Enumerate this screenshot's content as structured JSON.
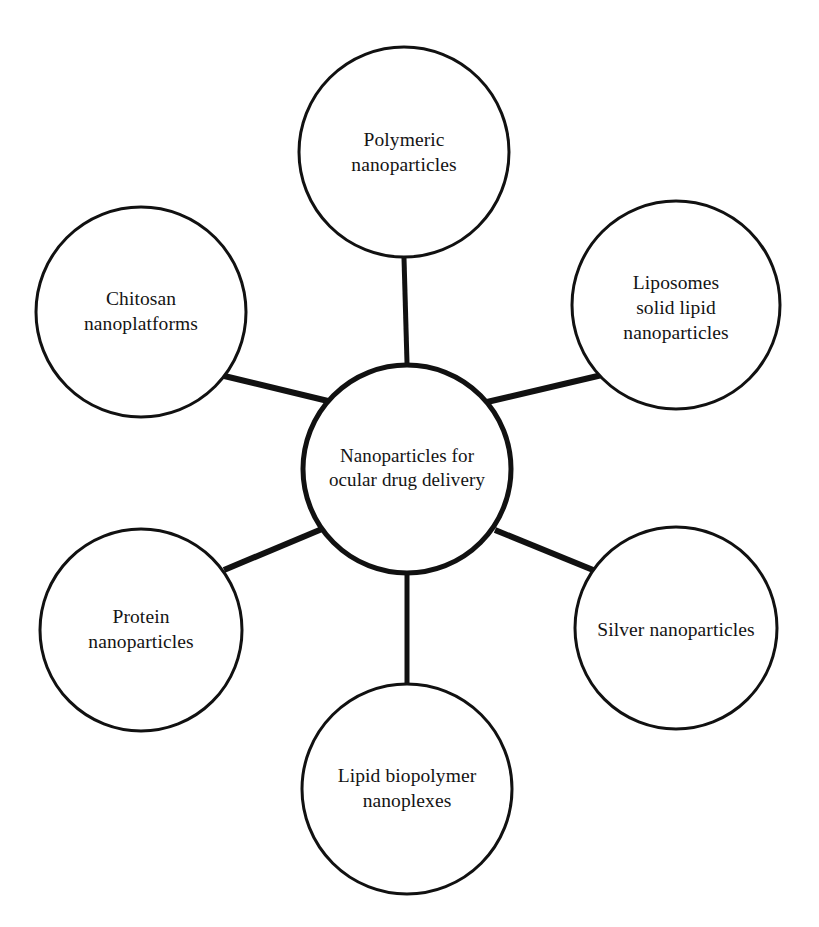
{
  "diagram": {
    "type": "hub-and-spoke",
    "title": "Nanoparticles for ocular drug delivery",
    "background_color": "#ffffff",
    "stroke_color": "#111111",
    "text_color": "#141414",
    "center": {
      "id": "center-node",
      "label": "Nanoparticles for\nocular drug delivery",
      "line1": "Nanoparticles for",
      "line2": "ocular drug delivery",
      "cx": 407,
      "cy": 469,
      "r": 104,
      "stroke_width": 5
    },
    "nodes": [
      {
        "id": "polymeric-nanoparticles",
        "label": "Polymeric\nnanoparticles",
        "line1": "Polymeric",
        "line2": "nanoparticles",
        "position": "top",
        "cx": 404,
        "cy": 152,
        "r": 105,
        "stroke_width": 3,
        "label_offset_y": 14
      },
      {
        "id": "liposomes-solid-lipid-nanoparticles",
        "label": "Liposomes\nsolid lipid\nnanoparticles",
        "line1": "Liposomes",
        "line2": "solid lipid",
        "line3": "nanoparticles",
        "position": "top-right",
        "cx": 676,
        "cy": 305,
        "r": 104,
        "stroke_width": 3,
        "label_offset_y": 4
      },
      {
        "id": "silver-nanoparticles",
        "label": "Silver nanoparticles",
        "line1": "Silver nanoparticles",
        "position": "right",
        "cx": 676,
        "cy": 628,
        "r": 101,
        "stroke_width": 3,
        "label_offset_y": 2
      },
      {
        "id": "lipid-biopolymer-nanoplexes",
        "label": "Lipid biopolymer\nnanoplexes",
        "line1": "Lipid biopolymer",
        "line2": "nanoplexes",
        "position": "bottom",
        "cx": 407,
        "cy": 789,
        "r": 105,
        "stroke_width": 3,
        "label_offset_y": 0
      },
      {
        "id": "protein-nanoparticles",
        "label": "Protein\nnanoparticles",
        "line1": "Protein",
        "line2": "nanoparticles",
        "position": "left",
        "cx": 141,
        "cy": 630,
        "r": 101,
        "stroke_width": 3,
        "label_offset_y": 0
      },
      {
        "id": "chitosan-nanoplatforms",
        "label": "Chitosan\nnanoplatforms",
        "line1": "Chitosan",
        "line2": "nanoplatforms",
        "position": "top-left",
        "cx": 141,
        "cy": 312,
        "r": 105,
        "stroke_width": 3,
        "label_offset_y": 5
      }
    ],
    "connectors": [
      {
        "id": "connector-center-to-polymeric",
        "x1": 407,
        "y1": 363,
        "x2": 404,
        "y2": 258,
        "width": 5
      },
      {
        "id": "connector-center-to-liposomes",
        "x1": 487,
        "y1": 402,
        "x2": 602,
        "y2": 375,
        "width": 6
      },
      {
        "id": "connector-center-to-silver",
        "x1": 495,
        "y1": 530,
        "x2": 598,
        "y2": 572,
        "width": 6
      },
      {
        "id": "connector-center-to-lipid-biopolymer",
        "x1": 407,
        "y1": 574,
        "x2": 407,
        "y2": 684,
        "width": 5
      },
      {
        "id": "connector-center-to-protein",
        "x1": 322,
        "y1": 529,
        "x2": 224,
        "y2": 570,
        "width": 6
      },
      {
        "id": "connector-center-to-chitosan",
        "x1": 328,
        "y1": 401,
        "x2": 216,
        "y2": 374,
        "width": 6
      }
    ]
  }
}
